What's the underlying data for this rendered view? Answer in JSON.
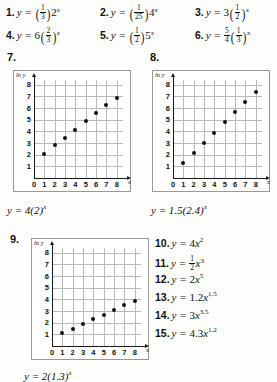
{
  "worksheet": {
    "top_exercises": [
      {
        "number": "1.",
        "lhs": "y =",
        "coef_num": "1",
        "coef_den": "3",
        "base": "2",
        "exp": "x",
        "form": "frac-paren-base"
      },
      {
        "number": "2.",
        "lhs": "y =",
        "coef_num": "1",
        "coef_den": "25",
        "base": "4",
        "exp": "x",
        "form": "frac-paren-base"
      },
      {
        "number": "3.",
        "lhs": "y =",
        "coef": "3",
        "base_num": "1",
        "base_den": "2",
        "exp": "x",
        "form": "coef-paren-frac"
      },
      {
        "number": "4.",
        "lhs": "y =",
        "coef": "6",
        "base_num": "2",
        "base_den": "3",
        "exp": "x",
        "form": "coef-paren-frac"
      },
      {
        "number": "5.",
        "lhs": "y =",
        "coef_num": "1",
        "coef_den": "2",
        "base": "5",
        "exp": "x",
        "form": "frac-paren-base"
      },
      {
        "number": "6.",
        "lhs": "y =",
        "coef_num": "5",
        "coef_den": "4",
        "base_num": "1",
        "base_den": "3",
        "exp": "x",
        "form": "frac-coef-paren-frac"
      }
    ],
    "graph_exercises": [
      {
        "number": "7.",
        "caption": "y = 4(2)"
      },
      {
        "number": "8.",
        "caption": "y = 1.5(2.4)"
      },
      {
        "number": "9.",
        "caption": "y = 2(1.3)"
      }
    ],
    "caption_exponent": "x",
    "right_exercises": [
      {
        "number": "10.",
        "lhs": "y =",
        "coef": "4",
        "var": "x",
        "exp": "2",
        "form": "plain"
      },
      {
        "number": "11.",
        "lhs": "y =",
        "coef_num": "1",
        "coef_den": "2",
        "var": "x",
        "exp": "3",
        "form": "frac"
      },
      {
        "number": "12.",
        "lhs": "y =",
        "coef": "2",
        "var": "x",
        "exp": "5",
        "form": "plain"
      },
      {
        "number": "13.",
        "lhs": "y =",
        "coef": "1.2",
        "var": "x",
        "exp": "1.5",
        "form": "plain"
      },
      {
        "number": "14.",
        "lhs": "y =",
        "coef": "3",
        "var": "x",
        "exp": "3.5",
        "form": "plain"
      },
      {
        "number": "15.",
        "lhs": "y =",
        "coef": "4.3",
        "var": "x",
        "exp": "1.2",
        "form": "plain"
      }
    ]
  },
  "chart_data": [
    {
      "id": "graph-7",
      "type": "scatter",
      "title": "7.",
      "xlabel": "x",
      "ylabel": "ln y",
      "xlim": [
        0,
        8.6
      ],
      "ylim": [
        0,
        8.4
      ],
      "xticks": [
        "0",
        "1",
        "2",
        "3",
        "4",
        "5",
        "6",
        "7",
        "8"
      ],
      "yticks": [
        "0",
        "1",
        "2",
        "3",
        "4",
        "5",
        "6",
        "7",
        "8"
      ],
      "grid": true,
      "x": [
        1,
        2,
        3,
        4,
        5,
        6,
        7,
        8
      ],
      "values": [
        2.1,
        2.8,
        3.45,
        4.1,
        4.85,
        5.55,
        6.25,
        6.9
      ],
      "annotation": "y = 4(2)^x"
    },
    {
      "id": "graph-8",
      "type": "scatter",
      "title": "8.",
      "xlabel": "x",
      "ylabel": "ln y",
      "xlim": [
        0,
        8.6
      ],
      "ylim": [
        0,
        8.4
      ],
      "xticks": [
        "0",
        "1",
        "2",
        "3",
        "4",
        "5",
        "6",
        "7",
        "8"
      ],
      "yticks": [
        "0",
        "1",
        "2",
        "3",
        "4",
        "5",
        "6",
        "7",
        "8"
      ],
      "grid": true,
      "x": [
        1,
        2,
        3,
        4,
        5,
        6,
        7,
        8
      ],
      "values": [
        1.3,
        2.15,
        3.0,
        3.9,
        4.8,
        5.65,
        6.5,
        7.35
      ],
      "annotation": "y = 1.5(2.4)^x"
    },
    {
      "id": "graph-9",
      "type": "scatter",
      "title": "9.",
      "xlabel": "x",
      "ylabel": "ln y",
      "xlim": [
        0,
        8.6
      ],
      "ylim": [
        0,
        8.4
      ],
      "xticks": [
        "0",
        "1",
        "2",
        "3",
        "4",
        "5",
        "6",
        "7",
        "8"
      ],
      "yticks": [
        "0",
        "1",
        "2",
        "3",
        "4",
        "5",
        "6",
        "7",
        "8"
      ],
      "grid": true,
      "x": [
        1,
        2,
        3,
        4,
        5,
        6,
        7,
        8
      ],
      "values": [
        1.1,
        1.5,
        1.9,
        2.3,
        2.7,
        3.05,
        3.5,
        3.9
      ],
      "annotation": "y = 2(1.3)^x"
    }
  ],
  "colors": {
    "page_background": "#fdfdfc",
    "panel_background": "#ffffff",
    "panel_border": "#9a9a93",
    "grid": "#b9b9b9",
    "axis": "#1a1a1a",
    "marker": "#111111",
    "text": "#111111"
  }
}
